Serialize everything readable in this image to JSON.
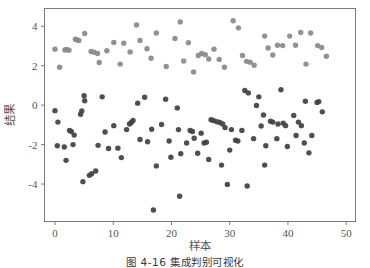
{
  "figure": {
    "caption": "图 4-16  集成判别可视化",
    "background_color": "#ffffff",
    "frame_color": "#7a7a7a"
  },
  "chart_data": {
    "type": "scatter",
    "title": "",
    "xlabel": "样本",
    "ylabel": "结果",
    "xlim": [
      -1.8,
      51.6
    ],
    "ylim": [
      -5.9,
      4.9
    ],
    "xticks": [
      0,
      10,
      20,
      30,
      40,
      50
    ],
    "xtick_labels": [
      "0",
      "10",
      "20",
      "30",
      "40",
      "50"
    ],
    "yticks": [
      -4,
      -2,
      0,
      2,
      4
    ],
    "ytick_labels": [
      "-4",
      "-2",
      "0",
      "2",
      "4"
    ],
    "grid": false,
    "legend": "none",
    "marker": "circle",
    "marker_size": 5.4,
    "series": [
      {
        "name": "cluster-light",
        "color": "#8a8a8a",
        "points": [
          [
            0.0,
            2.84
          ],
          [
            0.8,
            1.92
          ],
          [
            1.7,
            2.8
          ],
          [
            2.0,
            2.82
          ],
          [
            2.4,
            2.78
          ],
          [
            3.5,
            3.34
          ],
          [
            3.8,
            3.3
          ],
          [
            4.1,
            3.28
          ],
          [
            5.1,
            3.63
          ],
          [
            6.2,
            2.72
          ],
          [
            6.7,
            2.68
          ],
          [
            7.3,
            2.62
          ],
          [
            7.6,
            2.16
          ],
          [
            8.9,
            2.76
          ],
          [
            10.1,
            3.18
          ],
          [
            11.2,
            2.08
          ],
          [
            11.8,
            3.14
          ],
          [
            12.9,
            2.7
          ],
          [
            14.0,
            4.06
          ],
          [
            14.6,
            3.28
          ],
          [
            15.8,
            2.86
          ],
          [
            16.5,
            2.38
          ],
          [
            17.4,
            3.66
          ],
          [
            19.1,
            1.96
          ],
          [
            20.6,
            3.38
          ],
          [
            21.5,
            4.22
          ],
          [
            22.1,
            2.24
          ],
          [
            22.9,
            3.16
          ],
          [
            23.8,
            1.68
          ],
          [
            24.6,
            2.52
          ],
          [
            25.2,
            2.62
          ],
          [
            25.8,
            2.56
          ],
          [
            26.4,
            2.34
          ],
          [
            27.3,
            2.84
          ],
          [
            28.2,
            2.32
          ],
          [
            29.1,
            1.92
          ],
          [
            30.6,
            4.28
          ],
          [
            31.5,
            3.92
          ],
          [
            32.2,
            2.52
          ],
          [
            32.9,
            2.22
          ],
          [
            33.5,
            2.18
          ],
          [
            34.2,
            2.02
          ],
          [
            36.0,
            3.5
          ],
          [
            36.6,
            2.9
          ],
          [
            37.4,
            2.54
          ],
          [
            38.2,
            3.04
          ],
          [
            39.1,
            3.02
          ],
          [
            40.3,
            3.5
          ],
          [
            41.3,
            3.04
          ],
          [
            42.2,
            3.68
          ],
          [
            43.1,
            2.08
          ],
          [
            43.9,
            3.66
          ],
          [
            45.1,
            3.02
          ],
          [
            45.8,
            2.92
          ],
          [
            46.6,
            2.48
          ]
        ]
      },
      {
        "name": "cluster-dark",
        "color": "#424242",
        "points": [
          [
            0.0,
            -0.28
          ],
          [
            0.5,
            -0.86
          ],
          [
            0.4,
            -2.06
          ],
          [
            1.6,
            -2.12
          ],
          [
            1.9,
            -2.8
          ],
          [
            2.5,
            -1.28
          ],
          [
            2.8,
            -1.34
          ],
          [
            3.3,
            -1.52
          ],
          [
            3.1,
            -2.0
          ],
          [
            4.4,
            -0.46
          ],
          [
            4.6,
            -0.3
          ],
          [
            5.0,
            0.48
          ],
          [
            5.1,
            0.22
          ],
          [
            4.8,
            -3.88
          ],
          [
            5.9,
            -3.56
          ],
          [
            6.3,
            -3.48
          ],
          [
            7.0,
            -3.34
          ],
          [
            7.4,
            -2.04
          ],
          [
            8.1,
            0.42
          ],
          [
            8.6,
            -1.36
          ],
          [
            9.2,
            -2.2
          ],
          [
            10.1,
            -1.04
          ],
          [
            10.8,
            -2.18
          ],
          [
            11.4,
            -2.66
          ],
          [
            12.3,
            -1.24
          ],
          [
            12.8,
            -0.96
          ],
          [
            13.1,
            -0.88
          ],
          [
            13.4,
            -0.78
          ],
          [
            14.2,
            0.1
          ],
          [
            14.6,
            -1.74
          ],
          [
            15.4,
            0.4
          ],
          [
            15.9,
            -1.86
          ],
          [
            16.6,
            -1.22
          ],
          [
            17.4,
            -3.08
          ],
          [
            16.9,
            -5.32
          ],
          [
            18.3,
            -0.98
          ],
          [
            19.0,
            0.3
          ],
          [
            19.6,
            -1.82
          ],
          [
            19.9,
            -2.64
          ],
          [
            21.0,
            -0.14
          ],
          [
            21.2,
            -1.24
          ],
          [
            21.6,
            -2.46
          ],
          [
            21.4,
            -4.62
          ],
          [
            22.6,
            -1.92
          ],
          [
            23.2,
            -1.28
          ],
          [
            23.6,
            -1.34
          ],
          [
            23.9,
            -1.68
          ],
          [
            24.5,
            -2.44
          ],
          [
            25.1,
            -1.42
          ],
          [
            25.6,
            -1.92
          ],
          [
            26.0,
            -1.88
          ],
          [
            26.4,
            -2.76
          ],
          [
            26.8,
            -0.74
          ],
          [
            27.2,
            -0.78
          ],
          [
            27.8,
            -0.84
          ],
          [
            28.3,
            -0.88
          ],
          [
            28.8,
            -0.96
          ],
          [
            29.2,
            -1.14
          ],
          [
            28.6,
            -3.04
          ],
          [
            29.6,
            -4.02
          ],
          [
            30.3,
            -1.24
          ],
          [
            30.0,
            -2.28
          ],
          [
            31.0,
            -1.78
          ],
          [
            31.4,
            -1.82
          ],
          [
            32.1,
            -1.28
          ],
          [
            32.6,
            0.74
          ],
          [
            33.2,
            0.62
          ],
          [
            33.0,
            -4.1
          ],
          [
            34.1,
            -1.7
          ],
          [
            35.0,
            0.42
          ],
          [
            34.6,
            -0.02
          ],
          [
            35.4,
            -1.06
          ],
          [
            35.8,
            -0.5
          ],
          [
            36.2,
            -2.06
          ],
          [
            36.0,
            -3.04
          ],
          [
            37.0,
            -0.82
          ],
          [
            37.4,
            -0.86
          ],
          [
            38.1,
            -1.7
          ],
          [
            38.3,
            -0.96
          ],
          [
            38.8,
            0.78
          ],
          [
            39.2,
            -0.92
          ],
          [
            39.6,
            -1.04
          ],
          [
            39.9,
            -2.1
          ],
          [
            41.0,
            -0.52
          ],
          [
            41.4,
            -1.54
          ],
          [
            41.8,
            -0.86
          ],
          [
            42.3,
            -1.04
          ],
          [
            43.0,
            0.2
          ],
          [
            42.8,
            -1.92
          ],
          [
            43.6,
            -2.42
          ],
          [
            44.1,
            -1.54
          ],
          [
            45.0,
            0.14
          ],
          [
            45.3,
            0.18
          ],
          [
            45.9,
            -0.34
          ]
        ]
      }
    ]
  }
}
